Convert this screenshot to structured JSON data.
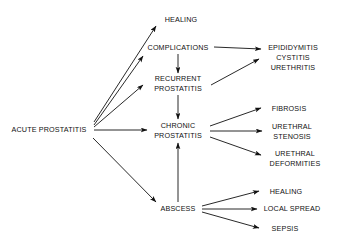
{
  "diagram": {
    "type": "flow-chart",
    "background_color": "#ffffff",
    "text_color": "#111111",
    "edge_color": "#111111",
    "nodes": [
      {
        "id": "acute-prostatitis",
        "label": "ACUTE PROSTATITIS",
        "lines": [
          "ACUTE PROSTATITIS"
        ],
        "x": 49,
        "y": 130,
        "align": "center"
      },
      {
        "id": "healing-top",
        "label": "HEALING",
        "lines": [
          "HEALING"
        ],
        "x": 181,
        "y": 20,
        "align": "center"
      },
      {
        "id": "complications",
        "label": "COMPLICATIONS",
        "lines": [
          "COMPLICATIONS"
        ],
        "x": 178,
        "y": 48,
        "align": "center"
      },
      {
        "id": "epididymitis-group",
        "label": "EPIDIDYMITIS CYSTITIS URETHRITIS",
        "lines": [
          "EPIDIDYMITIS",
          "CYSTITIS",
          "URETHRITIS"
        ],
        "x": 293,
        "y": 58,
        "align": "center"
      },
      {
        "id": "recurrent-prostatitis",
        "label": "RECURRENT PROSTATITIS",
        "lines": [
          "RECURRENT",
          "PROSTATITIS"
        ],
        "x": 178,
        "y": 84,
        "align": "center"
      },
      {
        "id": "chronic-prostatitis",
        "label": "CHRONIC PROSTATITIS",
        "lines": [
          "CHRONIC",
          "PROSTATITIS"
        ],
        "x": 178,
        "y": 131,
        "align": "center"
      },
      {
        "id": "fibrosis",
        "label": "FIBROSIS",
        "lines": [
          "FIBROSIS"
        ],
        "x": 289,
        "y": 109,
        "align": "center"
      },
      {
        "id": "urethral-stenosis",
        "label": "URETHRAL STENOSIS",
        "lines": [
          "URETHRAL",
          "STENOSIS"
        ],
        "x": 292,
        "y": 132,
        "align": "center"
      },
      {
        "id": "urethral-deformities",
        "label": "URETHRAL DEFORMITIES",
        "lines": [
          "URETHRAL",
          "DEFORMITIES"
        ],
        "x": 295,
        "y": 159,
        "align": "center"
      },
      {
        "id": "abscess",
        "label": "ABSCESS",
        "lines": [
          "ABSCESS"
        ],
        "x": 178,
        "y": 209,
        "align": "center"
      },
      {
        "id": "healing-bottom",
        "label": "HEALING",
        "lines": [
          "HEALING"
        ],
        "x": 286,
        "y": 192,
        "align": "center"
      },
      {
        "id": "local-spread",
        "label": "LOCAL SPREAD",
        "lines": [
          "LOCAL SPREAD"
        ],
        "x": 292,
        "y": 209,
        "align": "center"
      },
      {
        "id": "sepsis",
        "label": "SEPSIS",
        "lines": [
          "SEPSIS"
        ],
        "x": 285,
        "y": 229,
        "align": "center"
      }
    ],
    "edges": [
      {
        "id": "acute-to-healing",
        "from": "acute-prostatitis",
        "to": "healing-top",
        "x1": 94,
        "y1": 122,
        "x2": 156,
        "y2": 26
      },
      {
        "id": "acute-to-complications",
        "from": "acute-prostatitis",
        "to": "complications",
        "x1": 94,
        "y1": 125,
        "x2": 143,
        "y2": 56
      },
      {
        "id": "acute-to-recurrent",
        "from": "acute-prostatitis",
        "to": "recurrent-prostatitis",
        "x1": 94,
        "y1": 127,
        "x2": 143,
        "y2": 85
      },
      {
        "id": "acute-to-chronic",
        "from": "acute-prostatitis",
        "to": "chronic-prostatitis",
        "x1": 94,
        "y1": 130,
        "x2": 147,
        "y2": 130
      },
      {
        "id": "acute-to-abscess",
        "from": "acute-prostatitis",
        "to": "abscess",
        "x1": 93,
        "y1": 138,
        "x2": 156,
        "y2": 202
      },
      {
        "id": "complications-to-recurrent",
        "from": "complications",
        "to": "recurrent-prostatitis",
        "x1": 178,
        "y1": 54,
        "x2": 178,
        "y2": 73
      },
      {
        "id": "complications-to-epididymitis",
        "from": "complications",
        "to": "epididymitis-group",
        "x1": 214,
        "y1": 47,
        "x2": 261,
        "y2": 49
      },
      {
        "id": "recurrent-to-epididymitis",
        "from": "recurrent-prostatitis",
        "to": "epididymitis-group",
        "x1": 211,
        "y1": 85,
        "x2": 259,
        "y2": 59
      },
      {
        "id": "recurrent-to-chronic",
        "from": "recurrent-prostatitis",
        "to": "chronic-prostatitis",
        "x1": 178,
        "y1": 95,
        "x2": 178,
        "y2": 119
      },
      {
        "id": "chronic-to-fibrosis",
        "from": "chronic-prostatitis",
        "to": "fibrosis",
        "x1": 210,
        "y1": 126,
        "x2": 261,
        "y2": 108
      },
      {
        "id": "chronic-to-stenosis",
        "from": "chronic-prostatitis",
        "to": "urethral-stenosis",
        "x1": 210,
        "y1": 131,
        "x2": 262,
        "y2": 131
      },
      {
        "id": "chronic-to-deformities",
        "from": "chronic-prostatitis",
        "to": "urethral-deformities",
        "x1": 210,
        "y1": 137,
        "x2": 261,
        "y2": 155
      },
      {
        "id": "abscess-to-chronic",
        "from": "abscess",
        "to": "chronic-prostatitis",
        "x1": 178,
        "y1": 202,
        "x2": 178,
        "y2": 143
      },
      {
        "id": "abscess-to-healing",
        "from": "abscess",
        "to": "healing-bottom",
        "x1": 202,
        "y1": 206,
        "x2": 259,
        "y2": 191
      },
      {
        "id": "abscess-to-local-spread",
        "from": "abscess",
        "to": "local-spread",
        "x1": 202,
        "y1": 209,
        "x2": 257,
        "y2": 209
      },
      {
        "id": "abscess-to-sepsis",
        "from": "abscess",
        "to": "sepsis",
        "x1": 202,
        "y1": 212,
        "x2": 259,
        "y2": 228
      }
    ]
  }
}
